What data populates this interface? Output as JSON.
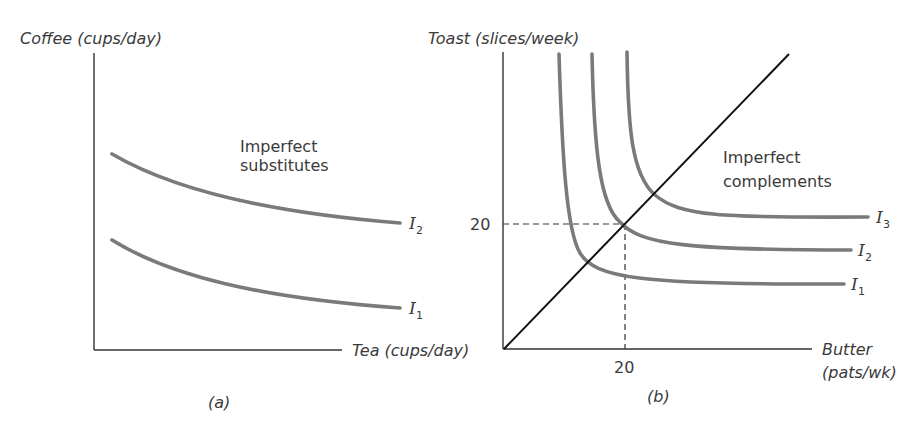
{
  "panels": [
    {
      "id": "a",
      "caption": "(a)",
      "y_axis_title": "Coffee (cups/day)",
      "x_axis_title": "Tea (cups/day)",
      "annotation_line1": "Imperfect",
      "annotation_line2": "substitutes",
      "curves": [
        {
          "name": "I",
          "sub": "2"
        },
        {
          "name": "I",
          "sub": "1"
        }
      ]
    },
    {
      "id": "b",
      "caption": "(b)",
      "y_axis_title": "Toast (slices/week)",
      "x_axis_title_line1": "Butter",
      "x_axis_title_line2": "(pats/wk)",
      "annotation_line1": "Imperfect",
      "annotation_line2": "complements",
      "x_tick": "20",
      "y_tick": "20",
      "curves": [
        {
          "name": "I",
          "sub": "3"
        },
        {
          "name": "I",
          "sub": "2"
        },
        {
          "name": "I",
          "sub": "1"
        }
      ]
    }
  ],
  "colors": {
    "curve": "#7a7a7a",
    "axis": "#333333",
    "ray": "#111111"
  }
}
